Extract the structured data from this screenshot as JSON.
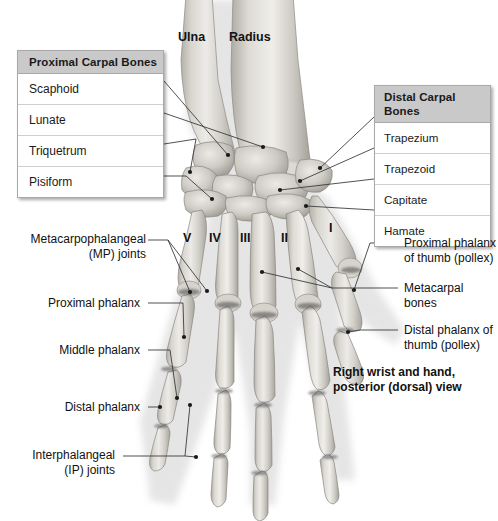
{
  "figure": {
    "caption_line1": "Right wrist and hand,",
    "caption_line2": "posterior (dorsal) view",
    "background_color": "#ffffff",
    "bone_color": "#c9c6c0",
    "leader_color": "#3a3a3a"
  },
  "forearm_labels": [
    {
      "name": "ulna",
      "text": "Ulna"
    },
    {
      "name": "radius",
      "text": "Radius"
    }
  ],
  "tables": [
    {
      "id": "proximal-carpal-bones",
      "header": "Proximal Carpal Bones",
      "header_bg": "#c9c9c9",
      "rows": [
        "Scaphoid",
        "Lunate",
        "Triquetrum",
        "Pisiform"
      ]
    },
    {
      "id": "distal-carpal-bones",
      "header": "Distal Carpal Bones",
      "header_bg": "#c9c9c9",
      "rows": [
        "Trapezium",
        "Trapezoid",
        "Capitate",
        "Hamate"
      ]
    }
  ],
  "digits": [
    {
      "name": "digit-v",
      "numeral": "V"
    },
    {
      "name": "digit-iv",
      "numeral": "IV"
    },
    {
      "name": "digit-iii",
      "numeral": "III"
    },
    {
      "name": "digit-ii",
      "numeral": "II"
    },
    {
      "name": "digit-i",
      "numeral": "I"
    }
  ],
  "callouts_left": [
    {
      "name": "mp-joints",
      "line1": "Metacarpophalangeal",
      "line2": "(MP) joints"
    },
    {
      "name": "proximal-phalanx",
      "line1": "Proximal phalanx",
      "line2": ""
    },
    {
      "name": "middle-phalanx",
      "line1": "Middle phalanx",
      "line2": ""
    },
    {
      "name": "distal-phalanx",
      "line1": "Distal phalanx",
      "line2": ""
    },
    {
      "name": "ip-joints",
      "line1": "Interphalangeal",
      "line2": "(IP) joints"
    }
  ],
  "callouts_right": [
    {
      "name": "proximal-phalanx-thumb",
      "line1": "Proximal phalanx",
      "line2": "of thumb (pollex)"
    },
    {
      "name": "metacarpal-bones",
      "line1": "Metacarpal",
      "line2": "bones"
    },
    {
      "name": "distal-phalanx-thumb",
      "line1": "Distal phalanx of",
      "line2": "thumb (pollex)"
    }
  ]
}
